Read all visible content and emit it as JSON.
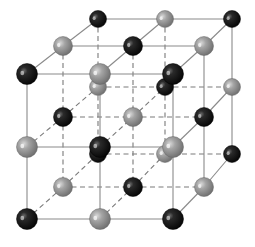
{
  "diagram": {
    "type": "crystal-lattice",
    "colors": {
      "background": "#ffffff",
      "ion_a": "#1a1a1a",
      "ion_a_label": "black ion",
      "ion_b": "#9a9a9a",
      "ion_b_label": "gray ion",
      "solid_edge": "#8a8a8a",
      "dashed_edge": "#7a7a7a"
    },
    "grid": {
      "layers": [
        {
          "name": "front",
          "xs": [
            27,
            100,
            173
          ],
          "ys": [
            74,
            147,
            219
          ],
          "r": 10.5
        },
        {
          "name": "middle",
          "xs": [
            63,
            133,
            204
          ],
          "ys": [
            46,
            117,
            187
          ],
          "r": 9.5
        },
        {
          "name": "back",
          "xs": [
            98,
            165,
            232
          ],
          "ys": [
            19,
            87,
            154
          ],
          "r": 8.5
        }
      ],
      "coloring_rule": "parity of (i+j+k): even = black, odd = gray"
    }
  }
}
